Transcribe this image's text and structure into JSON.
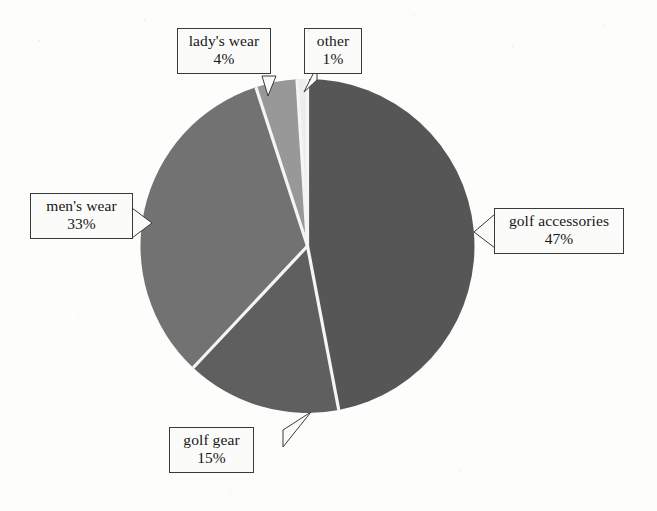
{
  "chart_data": {
    "type": "pie",
    "title": "",
    "categories": [
      "golf accessories",
      "golf gear",
      "men's wear",
      "lady's wear",
      "other"
    ],
    "values": [
      47,
      15,
      33,
      4,
      1
    ],
    "value_unit": "%",
    "start_angle_deg": 0,
    "direction": "clockwise",
    "legend": "none",
    "labels": [
      {
        "name": "golf accessories",
        "percent": "47%",
        "value": 47,
        "color": "#575757"
      },
      {
        "name": "golf gear",
        "percent": "15%",
        "value": 15,
        "color": "#5f5f5f"
      },
      {
        "name": "men's wear",
        "percent": "33%",
        "value": 33,
        "color": "#727272"
      },
      {
        "name": "lady's wear",
        "percent": "4%",
        "value": 4,
        "color": "#989898"
      },
      {
        "name": "other",
        "percent": "1%",
        "value": 1,
        "color": "#ededed"
      }
    ],
    "slice_separator_color": "#f5f5f3",
    "background_color": "#fdfdfc"
  },
  "chart": {
    "labels": {
      "ladys_wear": {
        "name": "lady's wear",
        "percent": "4%"
      },
      "other": {
        "name": "other",
        "percent": "1%"
      },
      "mens_wear": {
        "name": "men's wear",
        "percent": "33%"
      },
      "golf_accessories": {
        "name": "golf accessories",
        "percent": "47%"
      },
      "golf_gear": {
        "name": "golf gear",
        "percent": "15%"
      }
    }
  }
}
